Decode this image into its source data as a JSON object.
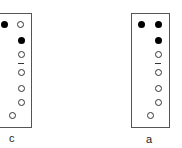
{
  "panels": [
    {
      "id": "c",
      "label": "c",
      "box": {
        "x": -2,
        "y": 13,
        "w": 34,
        "h": 115
      },
      "label_pos": {
        "x": 9,
        "y": 133
      },
      "dots": [
        {
          "type": "filled",
          "x": 4,
          "y": 24
        },
        {
          "type": "open",
          "x": 20,
          "y": 24
        },
        {
          "type": "filled",
          "x": 21,
          "y": 40
        },
        {
          "type": "open",
          "x": 21,
          "y": 54
        },
        {
          "type": "open",
          "x": 21,
          "y": 72
        },
        {
          "type": "open",
          "x": 21,
          "y": 88
        },
        {
          "type": "open",
          "x": 21,
          "y": 102
        },
        {
          "type": "open",
          "x": 12,
          "y": 115
        }
      ],
      "dash": {
        "x": 21,
        "y": 63
      }
    },
    {
      "id": "a",
      "label": "a",
      "box": {
        "x": 131,
        "y": 13,
        "w": 39,
        "h": 115
      },
      "label_pos": {
        "x": 146,
        "y": 134
      },
      "dots": [
        {
          "type": "filled",
          "x": 141,
          "y": 24
        },
        {
          "type": "filled",
          "x": 158,
          "y": 24
        },
        {
          "type": "filled",
          "x": 158,
          "y": 40
        },
        {
          "type": "open",
          "x": 158,
          "y": 54
        },
        {
          "type": "open",
          "x": 158,
          "y": 72
        },
        {
          "type": "open",
          "x": 158,
          "y": 88
        },
        {
          "type": "open",
          "x": 158,
          "y": 102
        },
        {
          "type": "open",
          "x": 150,
          "y": 115
        }
      ],
      "dash": {
        "x": 158,
        "y": 63
      }
    }
  ]
}
